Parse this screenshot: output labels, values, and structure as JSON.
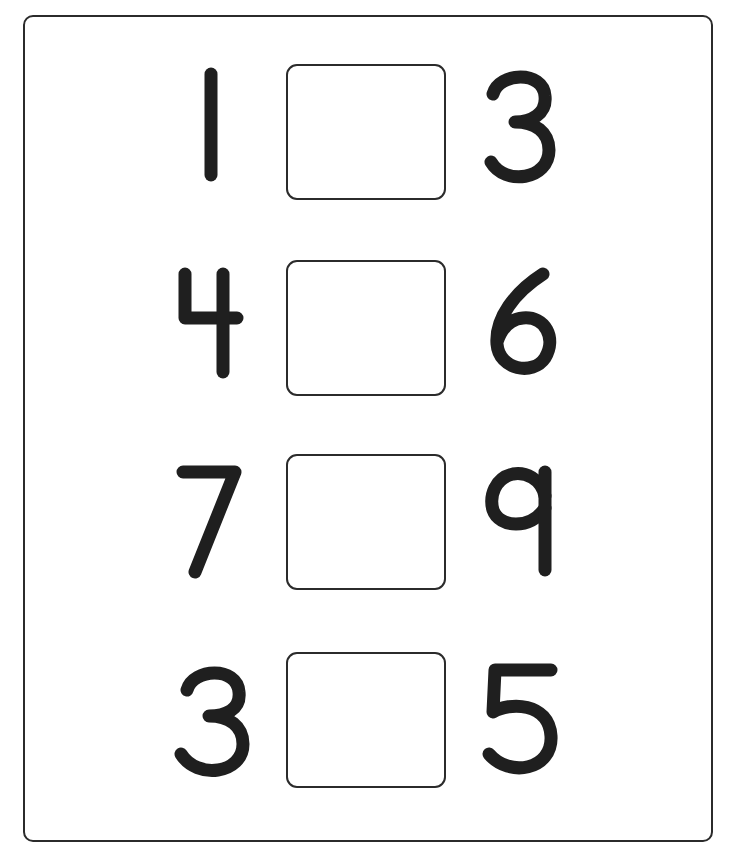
{
  "worksheet": {
    "instruction": "",
    "rows": [
      {
        "left": "1",
        "answer": "",
        "right": "3"
      },
      {
        "left": "4",
        "answer": "",
        "right": "6"
      },
      {
        "left": "7",
        "answer": "",
        "right": "9"
      },
      {
        "left": "3",
        "answer": "",
        "right": "5"
      }
    ],
    "colors": {
      "ink": "#1f1f1f",
      "border": "#2b2b2b",
      "paper": "#ffffff"
    }
  }
}
